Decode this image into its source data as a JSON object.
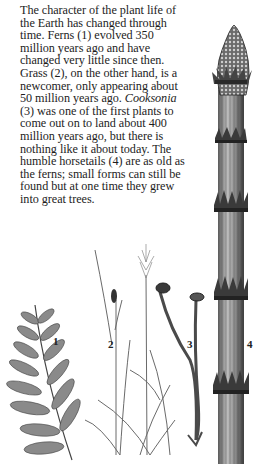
{
  "paragraph": {
    "lines": [
      "The character of the plant life of",
      "the Earth has changed through",
      "time. Ferns (1) evolved 350",
      "million years ago and have",
      "changed very little since then.",
      "Grass (2), on the other hand, is a",
      "newcomer, only appearing about",
      "50 million years ago. ",
      "(3) was one of the first plants to",
      "come out on to land about 400",
      "million years ago, but there is",
      "nothing like it about today. The",
      "humble horsetails (4) are as old as",
      "the ferns; small forms can still be",
      "found but at one time they grew",
      "into great trees."
    ],
    "italic_term": "Cooksonia"
  },
  "illustration": {
    "labels": [
      "1",
      "2",
      "3",
      "4"
    ],
    "plants": [
      {
        "number": "1",
        "name": "fern"
      },
      {
        "number": "2",
        "name": "grass"
      },
      {
        "number": "3",
        "name": "Cooksonia"
      },
      {
        "number": "4",
        "name": "horsetail"
      }
    ]
  }
}
